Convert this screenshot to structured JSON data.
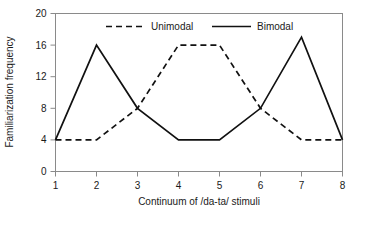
{
  "chart_data": {
    "type": "line",
    "title": "",
    "xlabel": "Continuum of /da-ta/ stimuli",
    "ylabel": "Familiarization frequency",
    "x": [
      1,
      2,
      3,
      4,
      5,
      6,
      7,
      8
    ],
    "categories": [
      "1",
      "2",
      "3",
      "4",
      "5",
      "6",
      "7",
      "8"
    ],
    "xlim": [
      1,
      8
    ],
    "ylim": [
      0,
      20
    ],
    "xticks": [
      "1",
      "2",
      "3",
      "4",
      "5",
      "6",
      "7",
      "8"
    ],
    "yticks": [
      "0",
      "4",
      "8",
      "12",
      "16",
      "20"
    ],
    "ytick_values": [
      0,
      4,
      8,
      12,
      16,
      20
    ],
    "grid": false,
    "legend_position": "top-inside",
    "frame": "box",
    "series": [
      {
        "name": "Unimodal",
        "style": "dashed",
        "color": "#111111",
        "values": [
          4,
          4,
          8,
          16,
          16,
          8,
          4,
          4
        ]
      },
      {
        "name": "Bimodal",
        "style": "solid",
        "color": "#111111",
        "values": [
          4,
          16,
          8,
          4,
          4,
          8,
          17,
          4
        ]
      }
    ]
  },
  "axes": {
    "x_title": "Continuum of /da-ta/ stimuli",
    "y_title": "Familiarization frequency"
  },
  "legend": {
    "unimodal_label": "Unimodal",
    "bimodal_label": "Bimodal"
  },
  "colors": {
    "frame": "#8a8a8a",
    "line": "#111111",
    "text": "#1a1a1a",
    "background": "#ffffff"
  }
}
